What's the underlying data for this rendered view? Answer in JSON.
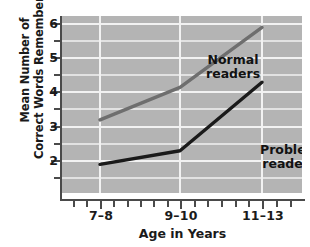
{
  "chart_data": {
    "type": "line",
    "title": "",
    "xlabel": "Age in Years",
    "ylabel_line1": "Mean Number of",
    "ylabel_line2": "Correct Words Remembered",
    "categories": [
      "7–8",
      "9–10",
      "11–13"
    ],
    "x_tick_labels": [
      "7–8",
      "9–10",
      "11–13"
    ],
    "y_tick_labels": [
      "6",
      "5",
      "4",
      "3",
      "2"
    ],
    "y_major_ticks": [
      6,
      5,
      4,
      3,
      2
    ],
    "y_minor_ticks": [
      6.5,
      5.5,
      4.5,
      3.5,
      2.5,
      1.5
    ],
    "ylim": [
      1.25,
      6.5
    ],
    "grid": "horizontal-and-vertical",
    "grid_color": "#f2f2f2",
    "plot_background": "#b4b4b4",
    "legend_position": "inline-annotation",
    "series": [
      {
        "name": "Normal readers",
        "label_line1": "Normal",
        "label_line2": "readers",
        "color": "#6e6e6e",
        "values": [
          3.2,
          4.15,
          5.9
        ]
      },
      {
        "name": "Problem readers",
        "label_line1": "Problem",
        "label_line2": "readers",
        "color": "#1a1a1a",
        "values": [
          1.9,
          2.3,
          4.3
        ]
      }
    ]
  }
}
